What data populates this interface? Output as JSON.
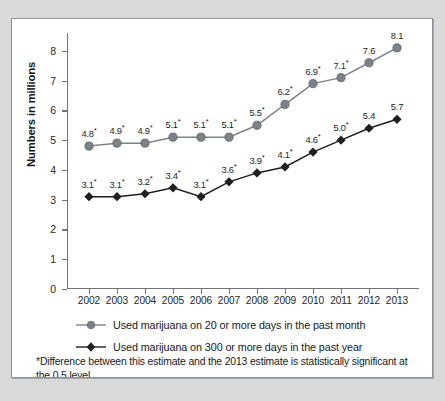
{
  "chart_data": {
    "type": "line",
    "title": "",
    "xlabel": "",
    "ylabel": "Numbers in millions",
    "ylim": [
      0,
      8.6
    ],
    "yticks": [
      "0",
      "1",
      "2",
      "3",
      "4",
      "5",
      "6",
      "7",
      "8"
    ],
    "grid": false,
    "legend_position": "bottom",
    "categories": [
      "2002",
      "2003",
      "2004",
      "2005",
      "2006",
      "2007",
      "2008",
      "2009",
      "2010",
      "2011",
      "2012",
      "2013"
    ],
    "series": [
      {
        "name": "Used marijuana on 20 or more days in the past month",
        "marker": "circle",
        "color": "#7d8288",
        "values": [
          4.8,
          4.9,
          4.9,
          5.1,
          5.1,
          5.1,
          5.5,
          6.2,
          6.9,
          7.1,
          7.6,
          8.1
        ],
        "labels": [
          "4.8*",
          "4.9*",
          "4.9*",
          "5.1*",
          "5.1*",
          "5.1*",
          "5.5*",
          "6.2*",
          "6.9*",
          "7.1*",
          "7.6",
          "8.1"
        ],
        "significant": [
          true,
          true,
          true,
          true,
          true,
          true,
          true,
          true,
          true,
          true,
          false,
          false
        ]
      },
      {
        "name": "Used marijuana on 300 or more days in the past year",
        "marker": "diamond",
        "color": "#1d1f22",
        "values": [
          3.1,
          3.1,
          3.2,
          3.4,
          3.1,
          3.6,
          3.9,
          4.1,
          4.6,
          5.0,
          5.4,
          5.7
        ],
        "labels": [
          "3.1*",
          "3.1*",
          "3.2*",
          "3.4*",
          "3.1*",
          "3.6*",
          "3.9*",
          "4.1*",
          "4.6*",
          "5.0*",
          "5.4",
          "5.7"
        ],
        "significant": [
          true,
          true,
          true,
          true,
          true,
          true,
          true,
          true,
          true,
          true,
          false,
          false
        ]
      }
    ],
    "annotations": [
      "*Difference between this estimate and the 2013 estimate is statistically significant at the 0.5 level."
    ]
  },
  "footnote": {
    "text": "*Difference between this estimate and the 2013 estimate is statistically significant at the 0.5 level."
  },
  "colors": {
    "series_1": "#7d8288",
    "series_2": "#1d1f22",
    "axis": "#6e7479",
    "frame": "#8d9299",
    "page_background": "#d9d9d9",
    "plot_background": "#ffffff"
  }
}
